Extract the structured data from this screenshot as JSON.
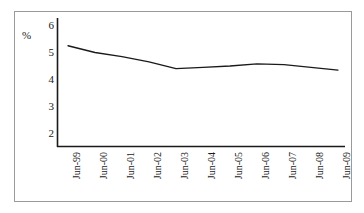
{
  "chart_data": {
    "type": "line",
    "title": "",
    "subtitle": "",
    "xlabel": "",
    "ylabel": "%",
    "y_unit_label": "%",
    "categories": [
      "Jun-99",
      "Jun-00",
      "Jun-01",
      "Jun-02",
      "Jun-03",
      "Jun-04",
      "Jun-05",
      "Jun-06",
      "Jun-07",
      "Jun-08",
      "Jun-09"
    ],
    "values": [
      5.25,
      5.0,
      4.85,
      4.65,
      4.4,
      4.45,
      4.5,
      4.58,
      4.55,
      4.45,
      4.35
    ],
    "series": [
      {
        "name": "",
        "values": [
          5.25,
          5.0,
          4.85,
          4.65,
          4.4,
          4.45,
          4.5,
          4.58,
          4.55,
          4.45,
          4.35
        ]
      }
    ],
    "ylim": [
      1.6,
      6.3
    ],
    "yticks": [
      2,
      3,
      4,
      5,
      6
    ],
    "ytick_labels": [
      "2",
      "3",
      "4",
      "5",
      "6"
    ],
    "xtick_labels": [
      "Jun-99",
      "Jun-00",
      "Jun-01",
      "Jun-02",
      "Jun-03",
      "Jun-04",
      "Jun-05",
      "Jun-06",
      "Jun-07",
      "Jun-08",
      "Jun-09"
    ],
    "grid": false,
    "legend": null,
    "line_color": "#1a1a1a",
    "axis_color": "#1a1a1a",
    "frame_color": "#9a9a9a",
    "background_color": "#ffffff"
  }
}
